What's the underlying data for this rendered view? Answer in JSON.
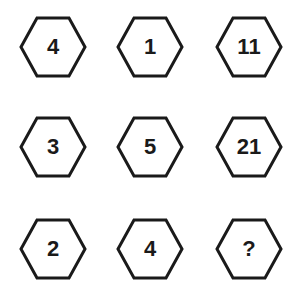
{
  "puzzle": {
    "grid": [
      [
        "4",
        "1",
        "11"
      ],
      [
        "3",
        "5",
        "21"
      ],
      [
        "2",
        "4",
        "?"
      ]
    ],
    "colors": {
      "stroke": "#1a1a1a",
      "background": "#ffffff"
    }
  }
}
